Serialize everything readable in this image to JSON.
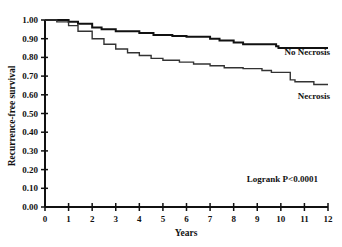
{
  "chart_data": {
    "type": "line",
    "subtype": "kaplan-meier step",
    "title": "",
    "xlabel": "Years",
    "ylabel": "Recurrence-free survival",
    "xlim": [
      0,
      12
    ],
    "ylim": [
      0.0,
      1.0
    ],
    "x_ticks": [
      "0",
      "1",
      "2",
      "3",
      "4",
      "5",
      "6",
      "7",
      "8",
      "9",
      "10",
      "11",
      "12"
    ],
    "y_ticks": [
      "0.00",
      "0.10",
      "0.20",
      "0.30",
      "0.40",
      "0.50",
      "0.60",
      "0.70",
      "0.80",
      "0.90",
      "1.00"
    ],
    "grid": false,
    "legend": "inline labels at right end of curves",
    "series": [
      {
        "name": "No Necrosis",
        "color": "#111111",
        "points": [
          [
            0,
            1.0
          ],
          [
            0.6,
            1.0
          ],
          [
            1.0,
            0.99
          ],
          [
            1.4,
            0.98
          ],
          [
            2.0,
            0.96
          ],
          [
            2.4,
            0.95
          ],
          [
            3.0,
            0.94
          ],
          [
            4.0,
            0.93
          ],
          [
            4.6,
            0.92
          ],
          [
            5.4,
            0.915
          ],
          [
            6.0,
            0.91
          ],
          [
            7.0,
            0.9
          ],
          [
            7.4,
            0.89
          ],
          [
            8.0,
            0.88
          ],
          [
            8.4,
            0.87
          ],
          [
            9.8,
            0.86
          ],
          [
            9.9,
            0.85
          ],
          [
            12.0,
            0.85
          ]
        ]
      },
      {
        "name": "Necrosis",
        "color": "#333333",
        "points": [
          [
            0,
            1.0
          ],
          [
            0.5,
            0.99
          ],
          [
            1.0,
            0.97
          ],
          [
            1.4,
            0.94
          ],
          [
            2.0,
            0.9
          ],
          [
            2.5,
            0.87
          ],
          [
            3.0,
            0.845
          ],
          [
            3.5,
            0.825
          ],
          [
            4.0,
            0.81
          ],
          [
            4.5,
            0.795
          ],
          [
            5.0,
            0.785
          ],
          [
            5.7,
            0.775
          ],
          [
            6.3,
            0.765
          ],
          [
            7.0,
            0.755
          ],
          [
            7.6,
            0.745
          ],
          [
            8.4,
            0.74
          ],
          [
            9.2,
            0.73
          ],
          [
            9.6,
            0.72
          ],
          [
            10.4,
            0.68
          ],
          [
            10.6,
            0.67
          ],
          [
            11.4,
            0.655
          ],
          [
            12.0,
            0.655
          ]
        ]
      }
    ],
    "annotations": [
      {
        "text": "No Necrosis",
        "x": 10.7,
        "y": 0.885
      },
      {
        "text": "Necrosis",
        "x": 11.0,
        "y": 0.59
      },
      {
        "text": "Logrank P<0.0001",
        "x": 10.6,
        "y": 0.15
      }
    ]
  },
  "labels": {
    "no_necrosis": "No Necrosis",
    "necrosis": "Necrosis",
    "logrank": "Logrank P<0.0001",
    "xlabel": "Years",
    "ylabel": "Recurrence-free survival"
  }
}
